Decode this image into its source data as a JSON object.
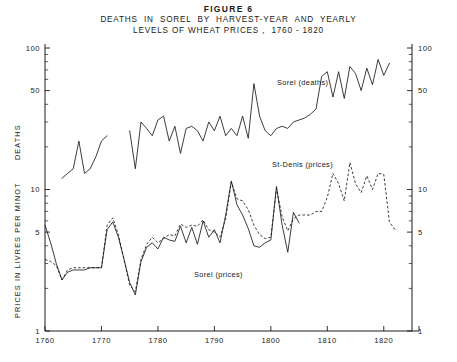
{
  "figure": {
    "number": "FIGURE 6",
    "title_line1": "DEATHS  IN  SOREL  BY  HARVEST-YEAR  AND  YEARLY",
    "title_line2": "LEVELS OF WHEAT PRICES ,  1760 - 1820"
  },
  "axes": {
    "left_title": "DEATHS",
    "left_title_2": "PRICES  IN  LIVRES  PER  MINOT",
    "left_ticks": [
      "100",
      "50",
      "10",
      "5",
      "1"
    ],
    "right_ticks": [
      "100",
      "50",
      "10",
      "5",
      "1"
    ],
    "x_ticks": [
      "1760",
      "1770",
      "1780",
      "1790",
      "1800",
      "1810",
      "1820"
    ]
  },
  "labels": {
    "deaths": "Sorel (deaths)",
    "st_denis": "St-Denis (prices)",
    "sorel_prices": "Sorel (prices)"
  },
  "chart_data": {
    "type": "line",
    "xlabel": "",
    "ylabel": "DEATHS / PRICES IN LIVRES PER MINOT",
    "yscale": "log",
    "ylim": [
      1,
      100
    ],
    "xlim": [
      1760,
      1825
    ],
    "ytick_values": [
      1,
      5,
      10,
      50,
      100
    ],
    "grid": false,
    "legend": "inline-annotations",
    "series": [
      {
        "name": "Sorel (deaths)",
        "style": "solid",
        "units": "deaths per harvest-year",
        "x": [
          1763,
          1764,
          1765,
          1766,
          1767,
          1768,
          1769,
          1770,
          1771,
          1775,
          1776,
          1777,
          1778,
          1779,
          1780,
          1781,
          1782,
          1783,
          1784,
          1785,
          1786,
          1787,
          1788,
          1789,
          1790,
          1791,
          1792,
          1793,
          1794,
          1795,
          1796,
          1797,
          1798,
          1799,
          1800,
          1801,
          1802,
          1803,
          1804,
          1805,
          1806,
          1807,
          1808,
          1809,
          1810,
          1811,
          1812,
          1813,
          1814,
          1815,
          1816,
          1817,
          1818,
          1819,
          1820,
          1821
        ],
        "y": [
          12,
          13,
          14,
          22,
          13,
          14,
          17,
          22,
          24,
          26,
          14,
          30,
          27,
          24,
          31,
          33,
          22,
          28,
          18,
          27,
          28,
          26,
          22,
          30,
          26,
          33,
          24,
          27,
          24,
          33,
          23,
          56,
          33,
          26,
          24,
          27,
          28,
          27,
          30,
          31,
          32,
          34,
          37,
          63,
          68,
          45,
          68,
          44,
          74,
          66,
          50,
          72,
          55,
          83,
          64,
          78
        ]
      },
      {
        "name": "Sorel (prices)",
        "style": "solid",
        "units": "livres per minot",
        "x": [
          1760,
          1761,
          1762,
          1763,
          1764,
          1765,
          1766,
          1767,
          1768,
          1769,
          1770,
          1771,
          1772,
          1773,
          1774,
          1775,
          1776,
          1777,
          1778,
          1779,
          1780,
          1781,
          1782,
          1783,
          1784,
          1785,
          1786,
          1787,
          1788,
          1789,
          1790,
          1791,
          1792,
          1793,
          1794,
          1795,
          1796,
          1797,
          1798,
          1799,
          1800,
          1801,
          1802,
          1803,
          1804,
          1805
        ],
        "y": [
          5.6,
          4.2,
          3.0,
          2.3,
          2.6,
          2.7,
          2.7,
          2.7,
          2.8,
          2.8,
          2.8,
          5.2,
          5.9,
          4.6,
          3.2,
          2.2,
          1.8,
          3.1,
          3.9,
          4.2,
          3.8,
          4.6,
          4.4,
          4.3,
          5.5,
          4.2,
          5.4,
          4.1,
          6.0,
          4.6,
          5.2,
          4.2,
          6.6,
          11.5,
          7.8,
          6.6,
          5.3,
          4.0,
          3.9,
          4.2,
          4.4,
          10.5,
          5.6,
          3.6,
          6.9,
          5.8
        ]
      },
      {
        "name": "St-Denis (prices)",
        "style": "dashed",
        "units": "livres per minot",
        "x": [
          1760,
          1761,
          1762,
          1763,
          1764,
          1765,
          1766,
          1767,
          1768,
          1769,
          1770,
          1771,
          1772,
          1773,
          1774,
          1775,
          1776,
          1777,
          1778,
          1779,
          1780,
          1781,
          1782,
          1783,
          1784,
          1785,
          1786,
          1787,
          1788,
          1789,
          1790,
          1791,
          1792,
          1793,
          1794,
          1795,
          1796,
          1797,
          1798,
          1799,
          1800,
          1801,
          1802,
          1803,
          1804,
          1805,
          1806,
          1807,
          1808,
          1809,
          1810,
          1811,
          1812,
          1813,
          1814,
          1815,
          1816,
          1817,
          1818,
          1819,
          1820,
          1821,
          1822
        ],
        "y": [
          3.2,
          3.1,
          2.9,
          2.3,
          2.7,
          2.8,
          2.8,
          2.8,
          2.8,
          2.8,
          2.8,
          5.6,
          6.3,
          4.8,
          3.2,
          2.1,
          1.9,
          3.2,
          4.1,
          4.6,
          4.2,
          4.5,
          4.8,
          4.7,
          5.7,
          5.4,
          5.6,
          5.5,
          6.1,
          5.2,
          5.0,
          4.6,
          6.2,
          11.3,
          8.6,
          8.3,
          7.2,
          5.6,
          4.8,
          4.5,
          4.6,
          10.2,
          6.4,
          5.1,
          6.2,
          6.6,
          6.6,
          6.6,
          7.0,
          7.0,
          8.8,
          13.0,
          11.0,
          8.3,
          15.5,
          11.0,
          9.5,
          12.5,
          10.0,
          13.0,
          12.8,
          5.9,
          5.2
        ]
      }
    ]
  }
}
